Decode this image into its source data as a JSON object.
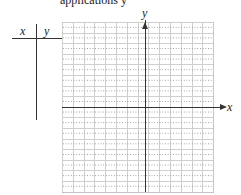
{
  "header": {
    "cut_text": "applications y"
  },
  "table": {
    "col_x": "x",
    "col_y": "y"
  },
  "axes": {
    "x_label": "x",
    "y_label": "y"
  },
  "grid": {
    "columns": 14,
    "rows": 16,
    "line_color": "#cfcfcf",
    "axis_color": "#333333"
  }
}
